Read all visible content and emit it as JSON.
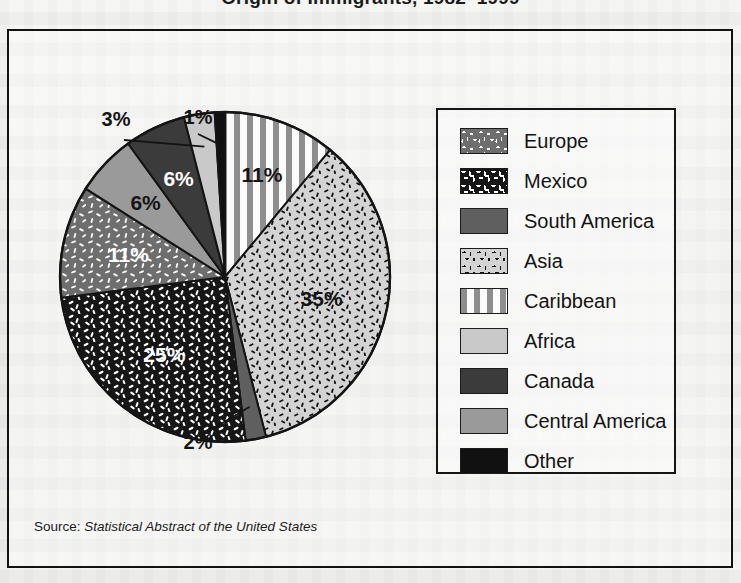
{
  "figure": {
    "title": "Origin of Immigrants, 1982–1999",
    "source_prefix": "Source: ",
    "source_italic": "Statistical Abstract of the United States"
  },
  "legend": {
    "items": [
      {
        "label": "Europe",
        "swatch": "europe-swatch",
        "pattern": "dark-gray-with-white-dashes"
      },
      {
        "label": "Mexico",
        "swatch": "mexico-swatch",
        "pattern": "black-with-white-dashes"
      },
      {
        "label": "South America",
        "swatch": "south-america-swatch",
        "pattern": "solid-medium-gray"
      },
      {
        "label": "Asia",
        "swatch": "asia-swatch",
        "pattern": "light-gray-with-black-dashes"
      },
      {
        "label": "Caribbean",
        "swatch": "caribbean-swatch",
        "pattern": "vertical-gray-white-stripes"
      },
      {
        "label": "Africa",
        "swatch": "africa-swatch",
        "pattern": "solid-light-gray"
      },
      {
        "label": "Canada",
        "swatch": "canada-swatch",
        "pattern": "solid-dark-gray"
      },
      {
        "label": "Central America",
        "swatch": "central-america-swatch",
        "pattern": "solid-mid-gray"
      },
      {
        "label": "Other",
        "swatch": "other-swatch",
        "pattern": "solid-black"
      }
    ]
  },
  "chart_data": {
    "type": "pie",
    "title": "Origin of Immigrants, 1982–1999",
    "xlabel": "",
    "ylabel": "",
    "legend_position": "right",
    "grid": false,
    "value_suffix": "%",
    "start_angle_deg": 0,
    "direction": "clockwise",
    "categories": [
      "Caribbean",
      "Asia",
      "South America",
      "Mexico",
      "Europe",
      "Central America",
      "Canada",
      "Africa",
      "Other"
    ],
    "values": [
      11,
      35,
      2,
      25,
      11,
      6,
      6,
      3,
      1
    ],
    "labels": [
      "11%",
      "35%",
      "2%",
      "25%",
      "11%",
      "6%",
      "6%",
      "3%",
      "1%"
    ],
    "slices": [
      {
        "name": "Caribbean",
        "value": 11,
        "label": "11%",
        "fill": "#fafafa",
        "label_color": "#141414",
        "label_placement": "inside",
        "callout": false
      },
      {
        "name": "Asia",
        "value": 35,
        "label": "35%",
        "fill": "#d3d3d3",
        "label_color": "#141414",
        "label_placement": "inside",
        "callout": false
      },
      {
        "name": "South America",
        "value": 2,
        "label": "2%",
        "fill": "#5f5f5f",
        "label_color": "#141414",
        "label_placement": "outside",
        "callout": true
      },
      {
        "name": "Mexico",
        "value": 25,
        "label": "25%",
        "fill": "#161616",
        "label_color": "#ffffff",
        "label_placement": "inside",
        "callout": false
      },
      {
        "name": "Europe",
        "value": 11,
        "label": "11%",
        "fill": "#6e6e6e",
        "label_color": "#ffffff",
        "label_placement": "inside",
        "callout": false
      },
      {
        "name": "Central America",
        "value": 6,
        "label": "6%",
        "fill": "#9a9a9a",
        "label_color": "#141414",
        "label_placement": "inside",
        "callout": false
      },
      {
        "name": "Canada",
        "value": 6,
        "label": "6%",
        "fill": "#3b3b3b",
        "label_color": "#ffffff",
        "label_placement": "inside",
        "callout": false
      },
      {
        "name": "Africa",
        "value": 3,
        "label": "3%",
        "fill": "#c9c9c9",
        "label_color": "#141414",
        "label_placement": "outside",
        "callout": true
      },
      {
        "name": "Other",
        "value": 1,
        "label": "1%",
        "fill": "#111111",
        "label_color": "#141414",
        "label_placement": "outside",
        "callout": true
      }
    ]
  },
  "colors": {
    "frame": "#121212",
    "legend_border": "#151515",
    "page_background": "#f2f2f0",
    "text": "#141414"
  }
}
